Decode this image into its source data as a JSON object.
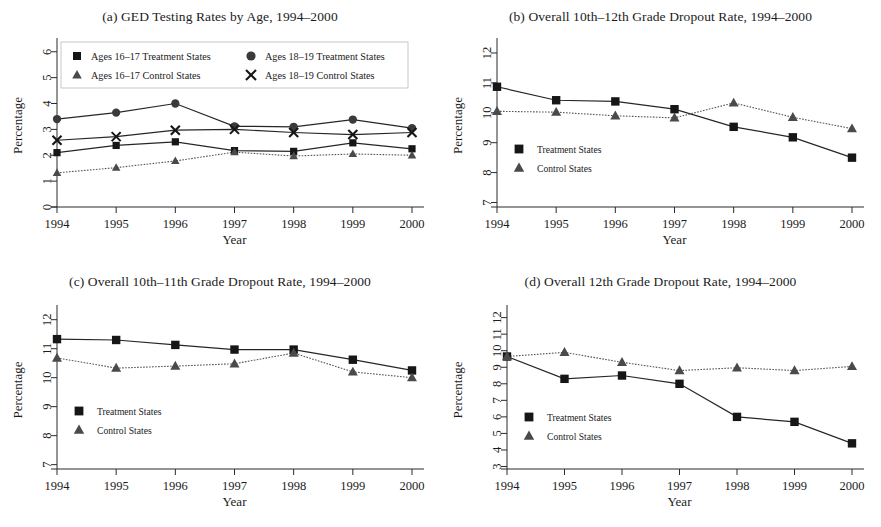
{
  "figure": {
    "xlabel": "Year",
    "ylabel": "Percentage",
    "years": [
      "1994",
      "1995",
      "1996",
      "1997",
      "1998",
      "1999",
      "2000"
    ]
  },
  "panel_a": {
    "title": "(a) GED Testing Rates by Age, 1994–2000",
    "legend": [
      "Ages 16–17 Treatment States",
      "Ages 18–19 Treatment States",
      "Ages 16–17 Control States",
      "Ages 18–19 Control States"
    ]
  },
  "panel_b": {
    "title": "(b) Overall 10th–12th Grade Dropout Rate, 1994–2000",
    "legend": [
      "Treatment States",
      "Control States"
    ]
  },
  "panel_c": {
    "title": "(c) Overall 10th–11th Grade Dropout Rate, 1994–2000",
    "legend": [
      "Treatment States",
      "Control States"
    ]
  },
  "panel_d": {
    "title": "(d) Overall 12th Grade Dropout Rate, 1994–2000",
    "legend": [
      "Treatment States",
      "Control States"
    ]
  },
  "chart_data": [
    {
      "id": "a",
      "type": "line",
      "title": "(a) GED Testing Rates by Age, 1994–2000",
      "xlabel": "Year",
      "ylabel": "Percentage",
      "x": [
        1994,
        1995,
        1996,
        1997,
        1998,
        1999,
        2000
      ],
      "categories": [
        "1994",
        "1995",
        "1996",
        "1997",
        "1998",
        "1999",
        "2000"
      ],
      "ylim": [
        0,
        6.3
      ],
      "yticks": [
        0,
        1,
        2,
        3,
        4,
        5,
        6
      ],
      "grid": false,
      "legend_position": "top-inside",
      "series": [
        {
          "name": "Ages 16–17 Treatment States",
          "marker": "square",
          "line": "solid",
          "values": [
            2.1,
            2.38,
            2.52,
            2.18,
            2.15,
            2.48,
            2.25
          ]
        },
        {
          "name": "Ages 16–17 Control States",
          "marker": "triangle",
          "line": "dotted",
          "values": [
            1.32,
            1.52,
            1.78,
            2.12,
            1.97,
            2.05,
            2.0
          ]
        },
        {
          "name": "Ages 18–19 Treatment States",
          "marker": "circle",
          "line": "solid",
          "values": [
            3.4,
            3.65,
            4.0,
            3.12,
            3.1,
            3.38,
            3.05
          ]
        },
        {
          "name": "Ages 18–19 Control States",
          "marker": "x",
          "line": "solid",
          "values": [
            2.58,
            2.72,
            2.97,
            3.0,
            2.88,
            2.8,
            2.88
          ]
        }
      ]
    },
    {
      "id": "b",
      "type": "line",
      "title": "(b) Overall 10th–12th Grade Dropout Rate, 1994–2000",
      "xlabel": "Year",
      "ylabel": "Percentage",
      "x": [
        1994,
        1995,
        1996,
        1997,
        1998,
        1999,
        2000
      ],
      "categories": [
        "1994",
        "1995",
        "1996",
        "1997",
        "1998",
        "1999",
        "2000"
      ],
      "ylim": [
        6.85,
        12.3
      ],
      "yticks": [
        7,
        8,
        9,
        10,
        11,
        12
      ],
      "grid": false,
      "legend_position": "bottom-left-inside",
      "series": [
        {
          "name": "Treatment States",
          "marker": "square",
          "line": "solid",
          "values": [
            10.87,
            10.42,
            10.38,
            10.12,
            9.53,
            9.18,
            8.5
          ]
        },
        {
          "name": "Control States",
          "marker": "triangle",
          "line": "dotted",
          "values": [
            10.05,
            10.02,
            9.9,
            9.83,
            10.33,
            9.85,
            9.47
          ]
        }
      ]
    },
    {
      "id": "c",
      "type": "line",
      "title": "(c) Overall 10th–11th Grade Dropout Rate, 1994–2000",
      "xlabel": "Year",
      "ylabel": "Percentage",
      "x": [
        1994,
        1995,
        1996,
        1997,
        1998,
        1999,
        2000
      ],
      "categories": [
        "1994",
        "1995",
        "1996",
        "1997",
        "1998",
        "1999",
        "2000"
      ],
      "ylim": [
        6.85,
        12.3
      ],
      "yticks": [
        7,
        8,
        9,
        10,
        11,
        12
      ],
      "grid": false,
      "legend_position": "bottom-left-inside",
      "series": [
        {
          "name": "Treatment States",
          "marker": "square",
          "line": "solid",
          "values": [
            11.33,
            11.3,
            11.13,
            10.97,
            10.97,
            10.62,
            10.25
          ]
        },
        {
          "name": "Control States",
          "marker": "triangle",
          "line": "dotted",
          "values": [
            10.68,
            10.33,
            10.4,
            10.48,
            10.85,
            10.2,
            10.0
          ]
        }
      ]
    },
    {
      "id": "d",
      "type": "line",
      "title": "(d) Overall 12th Grade Dropout Rate, 1994–2000",
      "xlabel": "Year",
      "ylabel": "Percentage",
      "x": [
        1994,
        1995,
        1996,
        1997,
        1998,
        1999,
        2000
      ],
      "categories": [
        "1994",
        "1995",
        "1996",
        "1997",
        "1998",
        "1999",
        "2000"
      ],
      "ylim": [
        2.85,
        12.4
      ],
      "yticks": [
        3,
        4,
        5,
        6,
        7,
        8,
        9,
        10,
        11,
        12
      ],
      "grid": false,
      "legend_position": "bottom-left-inside",
      "series": [
        {
          "name": "Treatment States",
          "marker": "square",
          "line": "solid",
          "values": [
            9.65,
            8.3,
            8.5,
            8.0,
            6.0,
            5.7,
            4.4
          ]
        },
        {
          "name": "Control States",
          "marker": "triangle",
          "line": "dotted",
          "values": [
            9.65,
            9.9,
            9.3,
            8.8,
            8.97,
            8.8,
            9.05
          ]
        }
      ]
    }
  ]
}
